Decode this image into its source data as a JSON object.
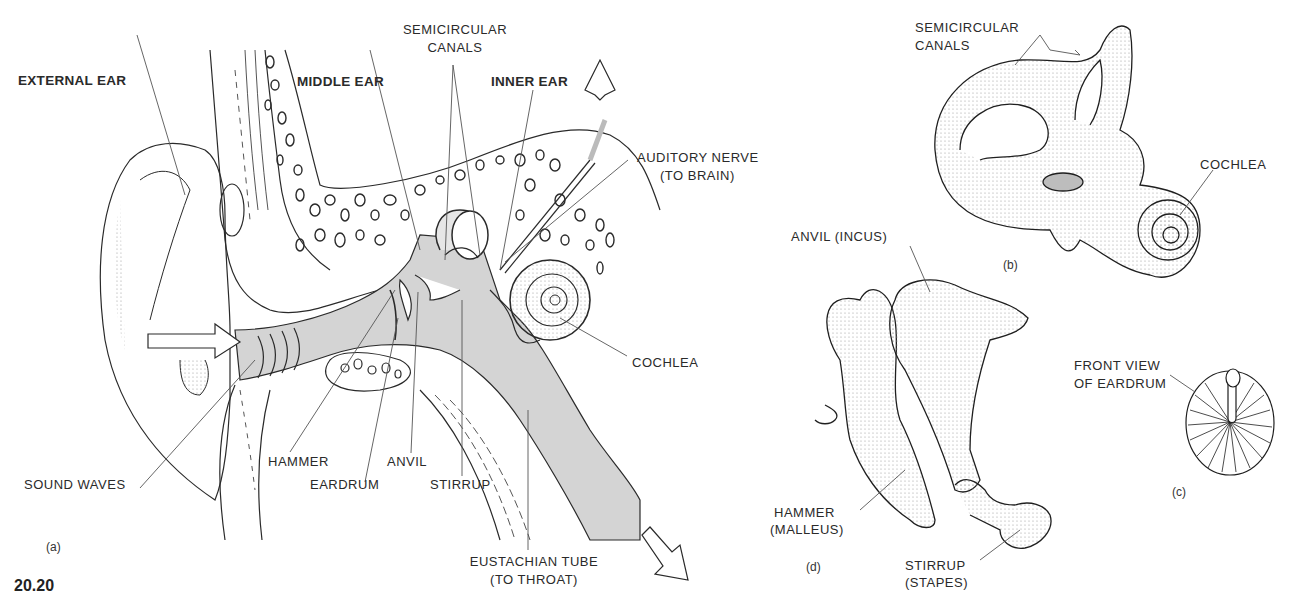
{
  "figure": {
    "number": "20.20"
  },
  "panels": {
    "a": {
      "tag": "(a)",
      "labels": {
        "external_ear": "EXTERNAL EAR",
        "middle_ear": "MIDDLE EAR",
        "semicircular_canals_1": "SEMICIRCULAR",
        "semicircular_canals_2": "CANALS",
        "inner_ear": "INNER EAR",
        "auditory_nerve_1": "AUDITORY NERVE",
        "auditory_nerve_2": "(TO BRAIN)",
        "cochlea": "COCHLEA",
        "sound_waves": "SOUND WAVES",
        "hammer": "HAMMER",
        "eardrum": "EARDRUM",
        "anvil": "ANVIL",
        "stirrup": "STIRRUP",
        "eustachian_1": "EUSTACHIAN TUBE",
        "eustachian_2": "(TO THROAT)"
      }
    },
    "b": {
      "tag": "(b)",
      "labels": {
        "semicircular_canals_1": "SEMICIRCULAR",
        "semicircular_canals_2": "CANALS",
        "cochlea": "COCHLEA"
      }
    },
    "c": {
      "tag": "(c)",
      "labels": {
        "front_view_1": "FRONT VIEW",
        "front_view_2": "OF EARDRUM"
      }
    },
    "d": {
      "tag": "(d)",
      "labels": {
        "anvil": "ANVIL (INCUS)",
        "hammer_1": "HAMMER",
        "hammer_2": "(MALLEUS)",
        "stirrup_1": "STIRRUP",
        "stirrup_2": "(STAPES)"
      }
    }
  },
  "colors": {
    "ink": "#2a2a2a",
    "canal_fill": "#d4d4d4",
    "background": "#ffffff"
  }
}
